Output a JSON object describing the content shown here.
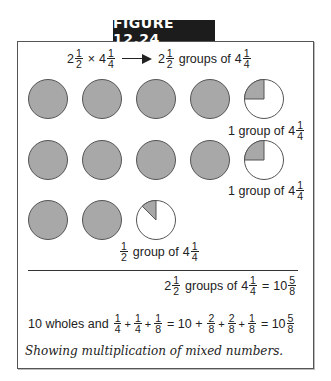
{
  "figure": {
    "title": "FIGURE 12.24",
    "caption": "Showing multiplication of mixed numbers."
  },
  "header_equation": {
    "left": {
      "whole": "2",
      "num": "1",
      "den": "2"
    },
    "times": "×",
    "right": {
      "whole": "4",
      "num": "1",
      "den": "4"
    },
    "arrow": "arrow-right",
    "result_whole": "2",
    "result_num": "1",
    "result_den": "2",
    "result_text": "groups of",
    "result_of_whole": "4",
    "result_of_num": "1",
    "result_of_den": "4"
  },
  "rows": [
    {
      "full_circles": 4,
      "partial_fraction": 0.25,
      "label": {
        "prefix": "1 group of",
        "whole": "4",
        "num": "1",
        "den": "4"
      }
    },
    {
      "full_circles": 4,
      "partial_fraction": 0.25,
      "label": {
        "prefix": "1 group of",
        "whole": "4",
        "num": "1",
        "den": "4"
      }
    },
    {
      "full_circles": 2,
      "partial_fraction": 0.125,
      "label": {
        "frac_num": "1",
        "frac_den": "2",
        "prefix": "group of",
        "whole": "4",
        "num": "1",
        "den": "4"
      }
    }
  ],
  "colors": {
    "fill": "#a8a8a8",
    "stroke": "#555555",
    "empty": "#ffffff"
  },
  "summary_line": {
    "lead_whole": "2",
    "lead_num": "1",
    "lead_den": "2",
    "text": "groups of",
    "of_whole": "4",
    "of_num": "1",
    "of_den": "4",
    "equals": "=",
    "res_whole": "10",
    "res_num": "5",
    "res_den": "8"
  },
  "sum_line": {
    "prefix": "10 wholes and",
    "terms": [
      {
        "num": "1",
        "den": "4"
      },
      {
        "op": "+"
      },
      {
        "num": "1",
        "den": "4"
      },
      {
        "op": "+"
      },
      {
        "num": "1",
        "den": "8"
      }
    ],
    "eq1": "= 10 +",
    "terms2": [
      {
        "num": "2",
        "den": "8"
      },
      {
        "op": "+"
      },
      {
        "num": "2",
        "den": "8"
      },
      {
        "op": "+"
      },
      {
        "num": "1",
        "den": "8"
      }
    ],
    "eq2": "= 10",
    "res_num": "5",
    "res_den": "8"
  }
}
